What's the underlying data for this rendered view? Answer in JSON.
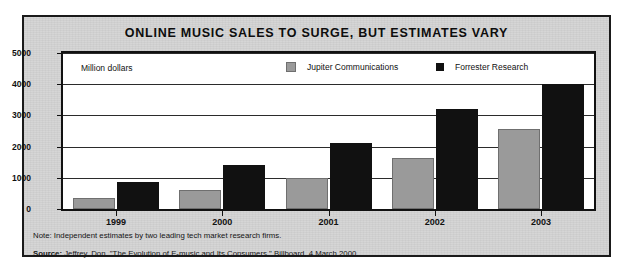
{
  "chart_data": {
    "type": "bar",
    "title": "ONLINE MUSIC SALES TO SURGE, BUT ESTIMATES VARY",
    "units_label": "Million dollars",
    "xlabel": "",
    "ylabel": "Million dollars",
    "categories": [
      "1999",
      "2000",
      "2001",
      "2002",
      "2003"
    ],
    "series": [
      {
        "name": "Jupiter Communications",
        "color": "#9a9a9a",
        "values": [
          350,
          600,
          1000,
          1620,
          2570
        ]
      },
      {
        "name": "Forrester Research",
        "color": "#111111",
        "values": [
          850,
          1400,
          2100,
          3200,
          4000
        ]
      }
    ],
    "ylim": [
      0,
      5000
    ],
    "yticks": [
      0,
      1000,
      2000,
      3000,
      4000,
      5000
    ],
    "ytick_labels": [
      "0",
      "1000",
      "2000",
      "3000",
      "4000",
      "5000"
    ],
    "grid": true,
    "legend_position": "top-inside"
  },
  "footer": {
    "note_label": "Note:",
    "note_text": "Independent estimates by two leading tech market research firms.",
    "source_label": "Source:",
    "source_text": "Jeffrey, Don. \"The Evolution of E-music and Its Consumers.\" Billboard, 4 March 2000."
  },
  "colors": {
    "card_background": "#d5d5d5",
    "plot_background": "#ffffff",
    "border": "#111111",
    "series_jupiter": "#9a9a9a",
    "series_forrester": "#111111"
  }
}
